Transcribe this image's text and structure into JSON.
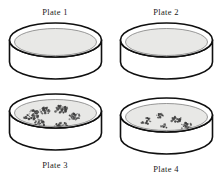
{
  "figure": {
    "background_color": "#ffffff",
    "outline_color": "#101010",
    "agar_color": "#e8e8e6",
    "colony_color": "#3d3d3d",
    "columns": 2,
    "rows": 2
  },
  "plates": [
    {
      "id": "plate-1",
      "label": "Plate 1",
      "label_position": "above",
      "grid_position": "top-left",
      "growth": "none",
      "colony_count": 0,
      "colonies": []
    },
    {
      "id": "plate-2",
      "label": "Plate 2",
      "label_position": "above",
      "grid_position": "top-right",
      "growth": "none",
      "colony_count": 0,
      "colonies": []
    },
    {
      "id": "plate-3",
      "label": "Plate 3",
      "label_position": "below",
      "grid_position": "bottom-left",
      "growth": "heavy",
      "colony_count": 7,
      "colonies": [
        {
          "cx": 26,
          "cy": 24,
          "r": 8.5,
          "density": 46
        },
        {
          "cx": 40,
          "cy": 20,
          "r": 6.0,
          "density": 30
        },
        {
          "cx": 35,
          "cy": 32,
          "r": 5.5,
          "density": 26
        },
        {
          "cx": 56,
          "cy": 18,
          "r": 7.0,
          "density": 36
        },
        {
          "cx": 69,
          "cy": 26,
          "r": 6.5,
          "density": 32
        },
        {
          "cx": 56,
          "cy": 36,
          "r": 7.5,
          "density": 38
        },
        {
          "cx": 38,
          "cy": 42,
          "r": 6.0,
          "density": 28
        }
      ]
    },
    {
      "id": "plate-4",
      "label": "Plate 4",
      "label_position": "below",
      "grid_position": "bottom-right",
      "growth": "sparse",
      "colony_count": 6,
      "colonies": [
        {
          "cx": 30,
          "cy": 26,
          "r": 5.5,
          "density": 22
        },
        {
          "cx": 44,
          "cy": 21,
          "r": 4.0,
          "density": 14
        },
        {
          "cx": 48,
          "cy": 31,
          "r": 3.5,
          "density": 12
        },
        {
          "cx": 60,
          "cy": 24,
          "r": 5.5,
          "density": 22
        },
        {
          "cx": 70,
          "cy": 31,
          "r": 6.0,
          "density": 24
        },
        {
          "cx": 46,
          "cy": 42,
          "r": 3.5,
          "density": 11
        }
      ]
    }
  ]
}
